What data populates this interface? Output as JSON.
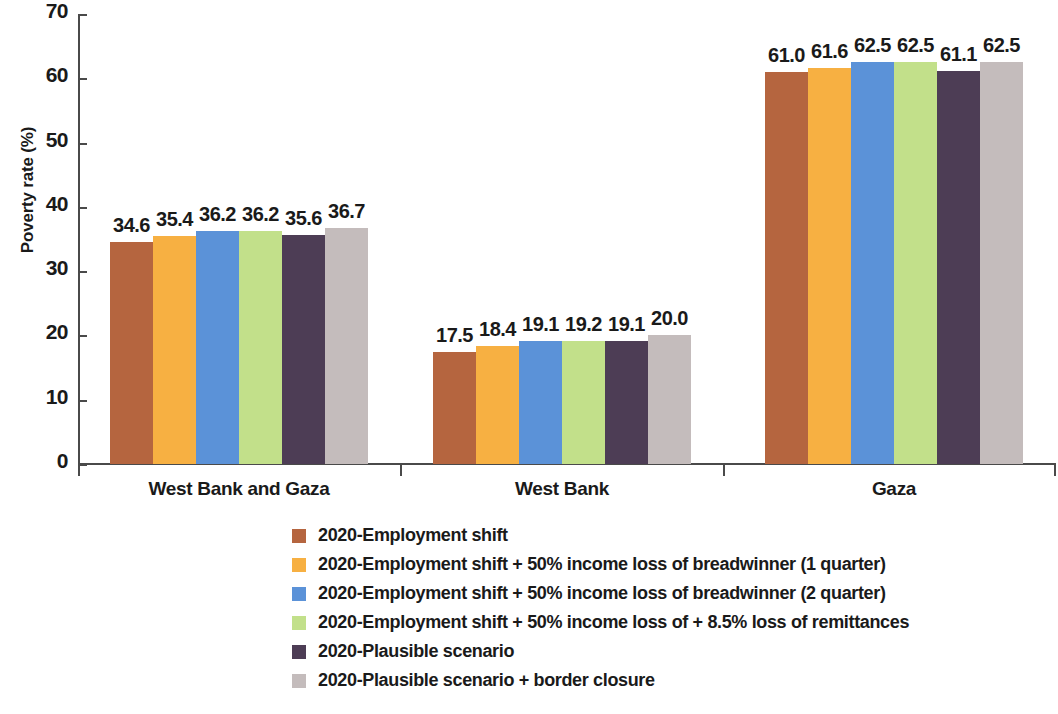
{
  "chart_data": {
    "type": "bar",
    "title": "",
    "xlabel": "",
    "ylabel": "Poverty rate (%)",
    "ylim": [
      0,
      70
    ],
    "ytick_labels": [
      "70",
      "60",
      "50",
      "40",
      "30",
      "20",
      "10",
      "0"
    ],
    "ytick_values": [
      70,
      60,
      50,
      40,
      30,
      20,
      10,
      0
    ],
    "grid": false,
    "legend_position": "bottom",
    "categories": [
      "West Bank and  Gaza",
      "West Bank",
      "Gaza"
    ],
    "series": [
      {
        "name": "2020-Employment shift",
        "color": "#b5653f",
        "values": [
          34.6,
          17.5,
          61.0
        ],
        "labels": [
          "34.6",
          "17.5",
          "61.0"
        ]
      },
      {
        "name": "2020-Employment shift + 50% income loss of breadwinner  (1 quarter)",
        "color": "#f7b042",
        "values": [
          35.4,
          18.4,
          61.6
        ],
        "labels": [
          "35.4",
          "18.4",
          "61.6"
        ]
      },
      {
        "name": "2020-Employment shift + 50% income loss of breadwinner (2 quarter)",
        "color": "#5b92d8",
        "values": [
          36.2,
          19.1,
          62.5
        ],
        "labels": [
          "36.2",
          "19.1",
          "62.5"
        ]
      },
      {
        "name": "2020-Employment shift + 50% income loss of + 8.5% loss of remittances",
        "color": "#c2e08a",
        "values": [
          36.2,
          19.2,
          62.5
        ],
        "labels": [
          "36.2",
          "19.2",
          "62.5"
        ]
      },
      {
        "name": "2020-Plausible scenario",
        "color": "#4d3d55",
        "values": [
          35.6,
          19.1,
          61.1
        ],
        "labels": [
          "35.6",
          "19.1",
          "61.1"
        ]
      },
      {
        "name": "2020-Plausible scenario + border closure",
        "color": "#c4bcbc",
        "values": [
          36.7,
          20.0,
          62.5
        ],
        "labels": [
          "36.7",
          "20.0",
          "62.5"
        ]
      }
    ]
  }
}
